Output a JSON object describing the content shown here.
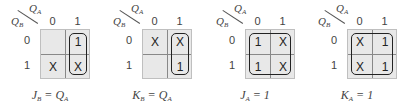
{
  "axes": {
    "col_var": "Q",
    "col_sub": "A",
    "row_var": "Q",
    "row_sub": "B",
    "col_labels": [
      "0",
      "1"
    ],
    "row_labels": [
      "0",
      "1"
    ]
  },
  "maps": [
    {
      "cells": [
        [
          "",
          "1"
        ],
        [
          "X",
          "X"
        ]
      ],
      "loop": "col1",
      "formula": {
        "lhs": "J",
        "lhs_sub": "B",
        "eq": " = ",
        "rhs": "Q",
        "rhs_sub": "A"
      }
    },
    {
      "cells": [
        [
          "X",
          "X"
        ],
        [
          "",
          "1"
        ]
      ],
      "loop": "col1",
      "formula": {
        "lhs": "K",
        "lhs_sub": "B",
        "eq": " = ",
        "rhs": "Q",
        "rhs_sub": "A"
      }
    },
    {
      "cells": [
        [
          "1",
          "X"
        ],
        [
          "1",
          "X"
        ]
      ],
      "loop": "all",
      "formula": {
        "lhs": "J",
        "lhs_sub": "A",
        "eq": " = ",
        "rhs": "1",
        "rhs_sub": ""
      }
    },
    {
      "cells": [
        [
          "X",
          "1"
        ],
        [
          "X",
          "1"
        ]
      ],
      "loop": "all",
      "formula": {
        "lhs": "K",
        "lhs_sub": "A",
        "eq": " = ",
        "rhs": "1",
        "rhs_sub": ""
      }
    }
  ]
}
